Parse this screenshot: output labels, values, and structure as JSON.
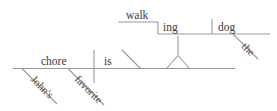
{
  "diagram": {
    "type": "sentence-diagram",
    "style": "Reed-Kellogg",
    "sentence": "John's favorite chore is walking the dog",
    "colors": {
      "line": "#9a9a9a",
      "text": "#3a3a3a",
      "background": "#ffffff"
    },
    "words": {
      "subject": "chore",
      "verb": "is",
      "possessive_modifier": "John's",
      "adjective_modifier": "favorite",
      "gerund_stem": "walk",
      "gerund_suffix": "ing",
      "object": "dog",
      "article": "the"
    },
    "labels": [
      {
        "id": "walk",
        "text": "walk"
      },
      {
        "id": "ing",
        "text": "ing"
      },
      {
        "id": "dog",
        "text": "dog"
      },
      {
        "id": "the",
        "text": "the"
      },
      {
        "id": "chore",
        "text": "chore"
      },
      {
        "id": "is",
        "text": "is"
      },
      {
        "id": "johns",
        "text": "John's"
      },
      {
        "id": "favorite",
        "text": "favorite"
      }
    ]
  }
}
